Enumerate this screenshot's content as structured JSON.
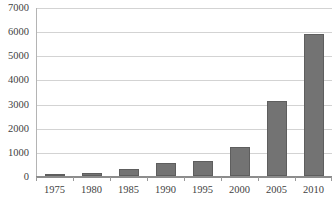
{
  "chart_data": {
    "type": "bar",
    "title": "",
    "subtitle": "",
    "xlabel": "",
    "ylabel": "",
    "categories": [
      "1975",
      "1980",
      "1985",
      "1990",
      "1995",
      "2000",
      "2005",
      "2010"
    ],
    "values": [
      100,
      120,
      290,
      550,
      620,
      1200,
      3100,
      5900
    ],
    "ylim": [
      0,
      7000
    ],
    "ytick_values": [
      0,
      1000,
      2000,
      3000,
      4000,
      5000,
      6000,
      7000
    ],
    "ytick_labels": [
      "0",
      "1000",
      "2000",
      "3000",
      "4000",
      "5000",
      "6000",
      "7000"
    ],
    "grid": true,
    "grid_axis": "y",
    "legend": false,
    "legend_position": "none",
    "bar_color": "#737373",
    "bar_edge_color": "#5e5e5e",
    "gridline_color": "#d3d3d3",
    "axis_color": "#8c8c8c",
    "background_color": "#ffffff",
    "text_color": "#3f3f3f"
  }
}
